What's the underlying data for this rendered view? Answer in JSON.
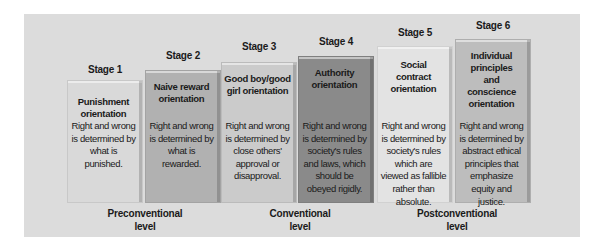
{
  "diagram": {
    "type": "staircase",
    "stages": [
      {
        "label": "Stage 1",
        "title": "Punishment orientation",
        "description": "Right and wrong is determined by what is punished.",
        "color": "#d9d9d9"
      },
      {
        "label": "Stage 2",
        "title": "Naive reward orientation",
        "description": "Right and wrong is determined by what is rewarded.",
        "color": "#b1b1b1"
      },
      {
        "label": "Stage 3",
        "title": "Good boy/good girl orientation",
        "description": "Right and wrong is determined by close others' approval or disapproval.",
        "color": "#cbcbcb"
      },
      {
        "label": "Stage 4",
        "title": "Authority orientation",
        "description": "Right and wrong is determined by society's rules and laws, which should be obeyed rigidly.",
        "color": "#8a8a8a"
      },
      {
        "label": "Stage 5",
        "title": "Social contract orientation",
        "description": "Right and wrong is determined by society's rules which are viewed as fallible rather than absolute.",
        "color": "#e3e3e3"
      },
      {
        "label": "Stage 6",
        "title": "Individual principles and conscience orientation",
        "description": "Right and wrong is determined by abstract ethical principles that emphasize equity and justice.",
        "color": "#bdbdbd"
      }
    ],
    "levels": [
      {
        "line1": "Preconventional",
        "line2": "level"
      },
      {
        "line1": "Conventional",
        "line2": "level"
      },
      {
        "line1": "Postconventional",
        "line2": "level"
      }
    ],
    "colors": {
      "panel": "#dcdcdc",
      "text": "#1a1a1a"
    }
  }
}
